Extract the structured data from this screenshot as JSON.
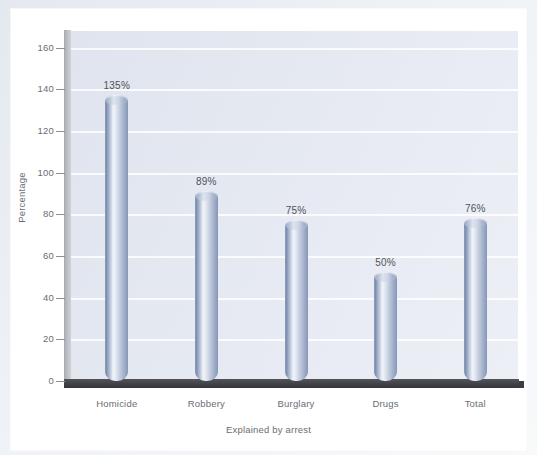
{
  "chart_data": {
    "type": "bar",
    "title": "",
    "xlabel": "Explained by arrest",
    "ylabel": "Percentage",
    "categories": [
      "Homicide",
      "Robbery",
      "Burglary",
      "Drugs",
      "Total"
    ],
    "values": [
      135,
      89,
      75,
      50,
      76
    ],
    "value_labels": [
      "135%",
      "89%",
      "75%",
      "50%",
      "76%"
    ],
    "ylim": [
      0,
      168
    ],
    "yticks": [
      0,
      20,
      40,
      60,
      80,
      100,
      120,
      140,
      160
    ],
    "ytick_labels": [
      "0",
      "20",
      "40",
      "60",
      "80",
      "100",
      "120",
      "140",
      "160"
    ],
    "grid": true,
    "grid_orientation": "horizontal",
    "legend": false,
    "legend_position": "none",
    "bar_style": "3d-cylinder",
    "colors": {
      "bar_light": "#f1f4f9",
      "bar_mid": "#c3cddf",
      "bar_dark": "#7d8fb1",
      "plot_background": "#e4e8f1",
      "gridline": "#ffffff",
      "axis_spine": "#babdc3",
      "floor": "#3e4045",
      "text": "#6a6d73",
      "page": "#ffffff",
      "frame": "#e4e9f0"
    }
  }
}
